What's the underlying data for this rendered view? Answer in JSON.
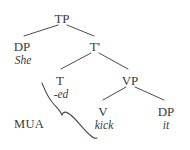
{
  "figure": {
    "type": "syntax-tree",
    "background_color": "#ffffff",
    "ink_color": "#3a3a3a",
    "sentence": "She -ed kick it"
  },
  "nodes": [
    {
      "id": "TP",
      "label": "TP",
      "x": 62,
      "y": 12,
      "style": "roman"
    },
    {
      "id": "DP1",
      "label": "DP",
      "x": 22,
      "y": 40,
      "style": "roman"
    },
    {
      "id": "Tbar",
      "label": "T'",
      "x": 95,
      "y": 40,
      "style": "roman"
    },
    {
      "id": "T",
      "label": "T",
      "x": 60,
      "y": 74,
      "style": "roman"
    },
    {
      "id": "VP",
      "label": "VP",
      "x": 130,
      "y": 74,
      "style": "roman"
    },
    {
      "id": "V",
      "label": "V",
      "x": 103,
      "y": 105,
      "style": "roman"
    },
    {
      "id": "DP2",
      "label": "DP",
      "x": 166,
      "y": 105,
      "style": "roman"
    }
  ],
  "terminals": [
    {
      "id": "she",
      "label": "She",
      "x": 23,
      "y": 55,
      "parent": "DP1"
    },
    {
      "id": "ed",
      "label": "-ed",
      "x": 61,
      "y": 89,
      "parent": "T"
    },
    {
      "id": "kick",
      "label": "kick",
      "x": 104,
      "y": 120,
      "parent": "V"
    },
    {
      "id": "it",
      "label": "it",
      "x": 166,
      "y": 120,
      "parent": "DP2"
    }
  ],
  "annotations": [
    {
      "id": "mua",
      "label": "MUA",
      "x": 29,
      "y": 118,
      "note": "merger-under-adjacency brace label"
    }
  ],
  "edges": [
    {
      "from": "TP",
      "to": "DP1",
      "x1": 58,
      "y1": 25,
      "x2": 24,
      "y2": 36
    },
    {
      "from": "TP",
      "to": "Tbar",
      "x1": 67,
      "y1": 25,
      "x2": 94,
      "y2": 36
    },
    {
      "from": "Tbar",
      "to": "T",
      "x1": 91,
      "y1": 53,
      "x2": 61,
      "y2": 69
    },
    {
      "from": "Tbar",
      "to": "VP",
      "x1": 99,
      "y1": 53,
      "x2": 128,
      "y2": 69
    },
    {
      "from": "VP",
      "to": "V",
      "x1": 126,
      "y1": 87,
      "x2": 103,
      "y2": 100
    },
    {
      "from": "VP",
      "to": "DP2",
      "x1": 135,
      "y1": 87,
      "x2": 164,
      "y2": 100
    }
  ],
  "brace": {
    "id": "mua-brace",
    "description": "rotated curly brace linking the -ed affix to the verb kick",
    "path": "M 42 83 C 45 90, 47 96, 52 102 C 57 108, 60 110, 62 115 C 64 110, 68 112, 74 118 C 80 124, 84 130, 90 135 C 93 138, 95 139, 97 138"
  }
}
